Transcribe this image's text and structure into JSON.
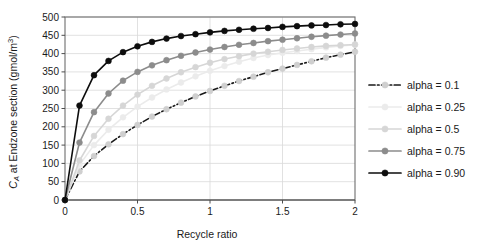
{
  "chart_data": {
    "type": "line",
    "title": "",
    "xlabel": "Recycle ratio",
    "ylabel": "C_A at  Endzone section (gmol/m3)",
    "ylabel_parts": {
      "main": "C",
      "sub": "A",
      "rest": " at  Endzone section (gmol/m",
      "sup": "3",
      "tail": ")"
    },
    "xlim": [
      0,
      2
    ],
    "ylim": [
      0,
      500
    ],
    "xticks": [
      0,
      0.5,
      1,
      1.5,
      2
    ],
    "xtick_labels": [
      "0",
      "0.5",
      "1",
      "1.5",
      "2"
    ],
    "yticks": [
      0,
      50,
      100,
      150,
      200,
      250,
      300,
      350,
      400,
      450,
      500
    ],
    "ytick_labels": [
      "0",
      "50",
      "100",
      "150",
      "200",
      "250",
      "300",
      "350",
      "400",
      "450",
      "500"
    ],
    "grid": "horizontal-and-vertical",
    "legend_position": "right",
    "x": [
      0,
      0.1,
      0.2,
      0.3,
      0.4,
      0.5,
      0.6,
      0.7,
      0.8,
      0.9,
      1.0,
      1.1,
      1.2,
      1.3,
      1.4,
      1.5,
      1.6,
      1.7,
      1.8,
      1.9,
      2.0
    ],
    "series": [
      {
        "name": "alpha = 0.1",
        "color": "#1a1a1a",
        "marker_color": "#cfcfcf",
        "line_style": "dash-dot",
        "values": [
          0,
          78,
          120,
          152,
          180,
          205,
          228,
          248,
          266,
          283,
          298,
          312,
          325,
          337,
          349,
          359,
          369,
          379,
          389,
          397,
          405
        ]
      },
      {
        "name": "alpha = 0.25",
        "color": "#ebebeb",
        "marker_color": "#ebebeb",
        "line_style": "solid",
        "values": [
          0,
          96,
          150,
          192,
          226,
          255,
          280,
          302,
          321,
          338,
          353,
          366,
          378,
          388,
          396,
          402,
          407,
          412,
          417,
          421,
          424
        ]
      },
      {
        "name": "alpha = 0.5",
        "color": "#d6d6d6",
        "marker_color": "#d6d6d6",
        "line_style": "solid",
        "values": [
          0,
          108,
          175,
          222,
          258,
          288,
          312,
          332,
          349,
          363,
          375,
          385,
          393,
          400,
          405,
          410,
          414,
          418,
          421,
          423,
          425
        ]
      },
      {
        "name": "alpha = 0.75",
        "color": "#8c8c8c",
        "marker_color": "#8c8c8c",
        "line_style": "solid",
        "values": [
          0,
          157,
          240,
          291,
          326,
          350,
          368,
          382,
          394,
          403,
          411,
          418,
          424,
          429,
          434,
          438,
          442,
          446,
          449,
          452,
          455
        ]
      },
      {
        "name": "alpha = 0.90",
        "color": "#0d0d0d",
        "marker_color": "#0d0d0d",
        "line_style": "solid",
        "values": [
          0,
          258,
          341,
          380,
          404,
          420,
          432,
          441,
          448,
          453,
          458,
          462,
          465,
          468,
          470,
          473,
          475,
          477,
          478,
          480,
          481
        ]
      }
    ]
  },
  "legend": {
    "items": [
      {
        "label": "alpha = 0.1"
      },
      {
        "label": "alpha = 0.25"
      },
      {
        "label": "alpha = 0.5"
      },
      {
        "label": "alpha = 0.75"
      },
      {
        "label": "alpha = 0.90"
      }
    ]
  }
}
